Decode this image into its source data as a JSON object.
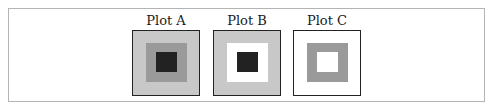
{
  "figure": {
    "plots": [
      {
        "title": "Plot A",
        "outer_color": "#c8c8c8",
        "middle_color": "#9a9a9a",
        "inner_color": "#222222"
      },
      {
        "title": "Plot B",
        "outer_color": "#c8c8c8",
        "middle_color": "#ffffff",
        "inner_color": "#222222"
      },
      {
        "title": "Plot C",
        "outer_color": "#ffffff",
        "middle_color": "#9a9a9a",
        "inner_color": "#ffffff"
      }
    ]
  }
}
